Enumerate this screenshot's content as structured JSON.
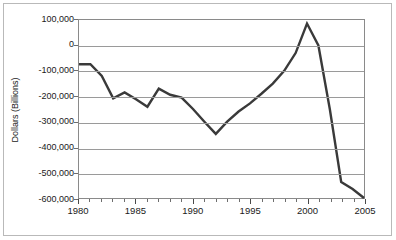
{
  "chart_data": {
    "type": "line",
    "title": "",
    "subtitle": "",
    "xlabel": "",
    "ylabel": "Dollars (Billions)",
    "xlim": [
      1980,
      2005
    ],
    "ylim": [
      -600000,
      100000
    ],
    "grid": true,
    "legend": false,
    "y_ticks": [
      100000,
      0,
      -100000,
      -200000,
      -300000,
      -400000,
      -500000,
      -600000
    ],
    "y_tick_labels": [
      "100,000",
      "0",
      "-100,000",
      "-200,000",
      "-300,000",
      "-400,000",
      "-500,000",
      "-600,000"
    ],
    "x_ticks": [
      1980,
      1985,
      1990,
      1995,
      2000,
      2005
    ],
    "x_tick_labels": [
      "1980",
      "1985",
      "1990",
      "1995",
      "2000",
      "2005"
    ],
    "x_minor_ticks": [
      1981,
      1982,
      1983,
      1984,
      1986,
      1987,
      1988,
      1989,
      1991,
      1992,
      1993,
      1994,
      1996,
      1997,
      1998,
      1999,
      2001,
      2002,
      2003,
      2004
    ],
    "series": [
      {
        "name": "Budget Surplus/Deficit",
        "color": "#3a3a3a",
        "x": [
          1980,
          1981,
          1982,
          1983,
          1984,
          1985,
          1986,
          1987,
          1988,
          1989,
          1990,
          1991,
          1992,
          1993,
          1994,
          1995,
          1996,
          1997,
          1998,
          1999,
          2000,
          2001,
          2002,
          2003,
          2004,
          2005
        ],
        "values": [
          -74000,
          -74000,
          -120000,
          -208000,
          -185000,
          -212000,
          -241000,
          -170000,
          -194000,
          -205000,
          -250000,
          -300000,
          -348000,
          -300000,
          -260000,
          -228000,
          -190000,
          -150000,
          -100000,
          -30000,
          86000,
          0,
          -250000,
          -537000,
          -565000,
          -600000
        ]
      }
    ]
  },
  "axes": {
    "y_axis_title": "Dollars (Billions)"
  },
  "style": {
    "line_color": "#3a3a3a",
    "grid_color": "#9a9a9a",
    "frame_color": "#8a8a8a",
    "outer_border_color": "#b9b9b9",
    "background": "#ffffff",
    "text_color": "#1a1a1a"
  }
}
